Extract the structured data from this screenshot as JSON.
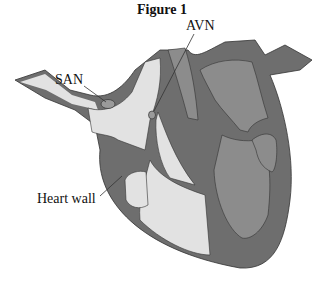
{
  "figure": {
    "title": "Figure 1",
    "labels": {
      "san": "SAN",
      "avn": "AVN",
      "heart_wall": "Heart wall"
    },
    "colors": {
      "wall": "#6e6e6e",
      "left_chambers": "#e2e2e2",
      "right_chambers": "#8c8c8c",
      "node": "#9a9a9a",
      "outline": "#333333"
    }
  }
}
